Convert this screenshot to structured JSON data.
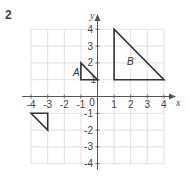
{
  "question_number": "2",
  "axes": {
    "x_label": "x",
    "y_label": "y",
    "x_ticks": [
      "-4",
      "-3",
      "-2",
      "-1",
      "1",
      "2",
      "3",
      "4"
    ],
    "y_ticks": [
      "4",
      "3",
      "2",
      "1",
      "-1",
      "-2",
      "-3",
      "-4"
    ],
    "origin_label": "0",
    "range": {
      "x": [
        -4,
        4
      ],
      "y": [
        -4,
        4
      ]
    }
  },
  "shapes": [
    {
      "label": "A",
      "vertices": [
        [
          -1,
          1
        ],
        [
          -1,
          2
        ],
        [
          0,
          1
        ]
      ]
    },
    {
      "label": "B",
      "vertices": [
        [
          1,
          1
        ],
        [
          1,
          4
        ],
        [
          4,
          1
        ]
      ]
    },
    {
      "label": "",
      "vertices": [
        [
          -4,
          -1
        ],
        [
          -3,
          -1
        ],
        [
          -3,
          -2
        ]
      ]
    }
  ],
  "colors": {
    "grid": "#d9d9d9",
    "axis": "#555555",
    "shape": "#333333"
  }
}
